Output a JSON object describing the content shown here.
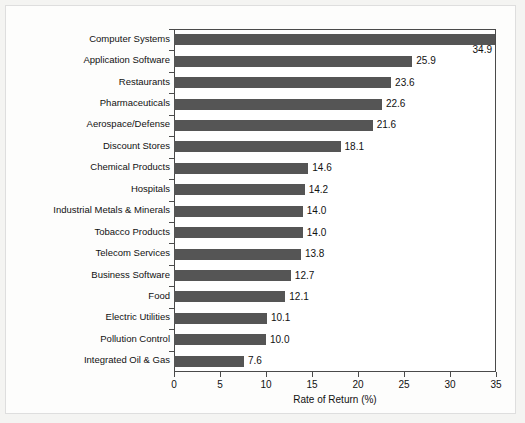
{
  "chart_data": {
    "type": "bar",
    "orientation": "horizontal",
    "title": "",
    "xlabel": "Rate of Return (%)",
    "ylabel": "",
    "xlim": [
      0,
      35
    ],
    "xticks": [
      0,
      5,
      10,
      15,
      20,
      25,
      30,
      35
    ],
    "xtick_labels": [
      "0",
      "5",
      "10",
      "15",
      "20",
      "25",
      "30",
      "35"
    ],
    "grid": false,
    "legend": null,
    "bar_color": "#555555",
    "frame_color": "#4a4a4a",
    "categories": [
      "Computer Systems",
      "Application Software",
      "Restaurants",
      "Pharmaceuticals",
      "Aerospace/Defense",
      "Discount Stores",
      "Chemical Products",
      "Hospitals",
      "Industrial Metals & Minerals",
      "Tobacco Products",
      "Telecom Services",
      "Business Software",
      "Food",
      "Electric Utilities",
      "Pollution Control",
      "Integrated Oil & Gas"
    ],
    "values": [
      34.9,
      25.9,
      23.6,
      22.6,
      21.6,
      18.1,
      14.6,
      14.2,
      14.0,
      14.0,
      13.8,
      12.7,
      12.1,
      10.1,
      10.0,
      7.6
    ],
    "data_labels": [
      "34.9",
      "25.9",
      "23.6",
      "22.6",
      "21.6",
      "18.1",
      "14.6",
      "14.2",
      "14.0",
      "14.0",
      "13.8",
      "12.7",
      "12.1",
      "10.1",
      "10.0",
      "7.6"
    ]
  }
}
